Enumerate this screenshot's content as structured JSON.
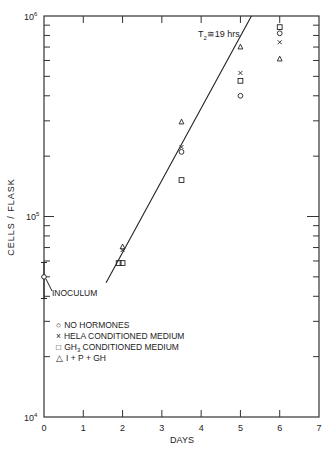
{
  "chart_data": {
    "type": "scatter",
    "title": "",
    "xlabel": "DAYS",
    "ylabel": "CELLS / FLASK",
    "xlim": [
      0,
      7
    ],
    "ylim": [
      10000,
      1000000
    ],
    "yscale": "log",
    "grid": false,
    "x_ticks": [
      "0",
      "1",
      "2",
      "3",
      "4",
      "5",
      "6",
      "7"
    ],
    "y_ticks": [
      {
        "base": "10",
        "exp": "4",
        "value": 10000
      },
      {
        "base": "10",
        "exp": "5",
        "value": 100000
      },
      {
        "base": "10",
        "exp": "6",
        "value": 1000000
      }
    ],
    "legend_position": "lower-left inside",
    "series": [
      {
        "name": "NO HORMONES",
        "marker": "circle",
        "points": [
          [
            3.5,
            210000
          ],
          [
            5,
            400000
          ],
          [
            6,
            820000
          ]
        ]
      },
      {
        "name": "HELA CONDITIONED MEDIUM",
        "marker": "x",
        "points": [
          [
            2,
            68000
          ],
          [
            3.5,
            222000
          ],
          [
            5,
            520000
          ],
          [
            6,
            740000
          ]
        ]
      },
      {
        "name": "GH3 CONDITIONED MEDIUM",
        "marker": "square",
        "points": [
          [
            1.9,
            58600
          ],
          [
            2,
            58600
          ],
          [
            3.5,
            152000
          ],
          [
            5,
            475000
          ],
          [
            6,
            880000
          ]
        ]
      },
      {
        "name": "I + P + GH",
        "marker": "triangle",
        "points": [
          [
            2,
            70500
          ],
          [
            3.5,
            296000
          ],
          [
            5,
            700000
          ],
          [
            6,
            610000
          ]
        ]
      }
    ],
    "inoculum": {
      "label": "INOCULUM",
      "x": 0,
      "y": 50000,
      "error_low": 39000,
      "error_high": 59000
    },
    "fit_line": {
      "label": "T2 ≅ 19 hrs",
      "from": [
        1.58,
        46700
      ],
      "to": [
        5.28,
        1000000
      ]
    }
  },
  "legend": {
    "items": [
      {
        "symbol": "○",
        "text": "NO HORMONES"
      },
      {
        "symbol": "×",
        "text": "HELA CONDITIONED MEDIUM"
      },
      {
        "symbol": "□",
        "text": "GH",
        "sub": "3",
        "rest": " CONDITIONED MEDIUM"
      },
      {
        "symbol": "△",
        "text": "I + P + GH"
      }
    ]
  },
  "annotations": {
    "doubling_time_main": "T",
    "doubling_time_sub": "2",
    "doubling_time_rest": "≅19 hrs",
    "inoculum": "INOCULUM"
  },
  "axes": {
    "xlabel": "DAYS",
    "ylabel": "CELLS / FLASK",
    "x_tick_labels": [
      "0",
      "1",
      "2",
      "3",
      "4",
      "5",
      "6",
      "7"
    ],
    "y_base": "10",
    "y_exp_low": "4",
    "y_exp_mid": "5",
    "y_exp_high": "6"
  }
}
